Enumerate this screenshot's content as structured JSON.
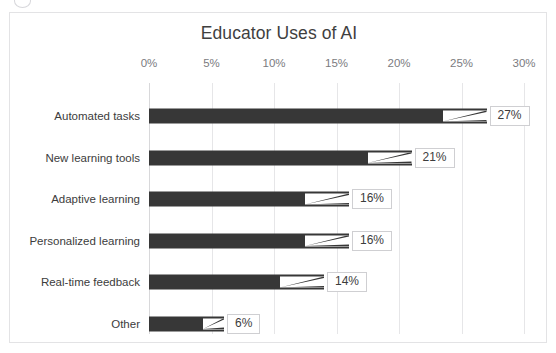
{
  "chart_data": {
    "type": "bar",
    "orientation": "horizontal",
    "title": "Educator Uses of AI",
    "xlabel": "",
    "ylabel": "",
    "xlim": [
      0,
      30
    ],
    "xtick_labels": [
      "0%",
      "5%",
      "10%",
      "15%",
      "20%",
      "25%",
      "30%"
    ],
    "xticks": [
      0,
      5,
      10,
      15,
      20,
      25,
      30
    ],
    "grid": true,
    "legend": false,
    "categories": [
      "Automated tasks",
      "New learning tools",
      "Adaptive learning",
      "Personalized learning",
      "Real-time feedback",
      "Other"
    ],
    "values": [
      27,
      21,
      16,
      16,
      14,
      6
    ],
    "data_labels": [
      "27%",
      "21%",
      "16%",
      "16%",
      "14%",
      "6%"
    ],
    "bar_color": "#373737",
    "gridline_color": "#e6e6e8",
    "label_box_border_color": "#cfcfd2",
    "title_color": "#3f3f3f",
    "tick_color": "#7b7b80",
    "category_color": "#3c3c3c",
    "frame_border_color": "#e3e3e5",
    "background_color": "#ffffff"
  }
}
